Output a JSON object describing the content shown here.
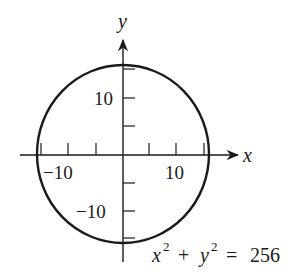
{
  "diagram": {
    "type": "circle-graph",
    "equation": {
      "lhs_x": "x",
      "lhs_y": "y",
      "exp": "2",
      "plus": "+",
      "equals": "=",
      "rhs": "256"
    },
    "axes": {
      "x_label": "x",
      "y_label": "y",
      "x_ticks": [
        -15,
        -10,
        -5,
        5,
        10,
        15
      ],
      "y_ticks": [
        -15,
        -10,
        -5,
        5,
        10,
        15
      ],
      "x_tick_labels": {
        "neg": "−10",
        "pos": "10"
      },
      "y_tick_labels": {
        "neg": "−10",
        "pos": "10"
      }
    },
    "circle": {
      "center": [
        0,
        0
      ],
      "radius": 16
    },
    "colors": {
      "stroke": "#1a1a1a",
      "background": "#ffffff"
    }
  }
}
